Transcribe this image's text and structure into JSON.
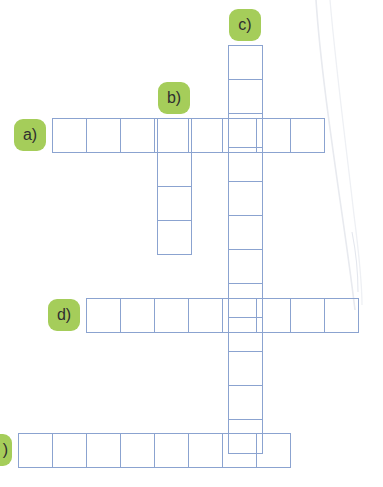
{
  "puzzle": {
    "type": "crossword",
    "title": "Crossword grid",
    "cell_size_px": 35,
    "grid_line_color": "#8ba3d0",
    "badge_color": "#a5cd5a",
    "badge_text_color": "#2f2f2f",
    "background_color": "#ffffff",
    "entries": [
      {
        "id": "a",
        "label": "a)",
        "orientation": "horizontal",
        "cells": 8,
        "x": 52,
        "y": 118,
        "badge_x": 14,
        "badge_y": 119,
        "badge_clipped": false,
        "letters": [
          "",
          "",
          "",
          "",
          "",
          "",
          "",
          ""
        ]
      },
      {
        "id": "b",
        "label": "b)",
        "orientation": "vertical",
        "cells": 4,
        "x": 157,
        "y": 118,
        "badge_x": 158,
        "badge_y": 82,
        "badge_clipped": false,
        "letters": [
          "",
          "",
          "",
          ""
        ]
      },
      {
        "id": "c",
        "label": "c)",
        "orientation": "vertical",
        "cells": 12,
        "x": 228,
        "y": 45,
        "badge_x": 229,
        "badge_y": 9,
        "badge_clipped": false,
        "letters": [
          "",
          "",
          "",
          "",
          "",
          "",
          "",
          "",
          "",
          "",
          "",
          ""
        ]
      },
      {
        "id": "d",
        "label": "d)",
        "orientation": "horizontal",
        "cells": 8,
        "x": 86,
        "y": 298,
        "badge_x": 48,
        "badge_y": 299,
        "badge_clipped": false,
        "letters": [
          "",
          "",
          "",
          "",
          "",
          "",
          "",
          ""
        ]
      },
      {
        "id": "e",
        "label": ")",
        "orientation": "horizontal",
        "cells": 8,
        "x": 18,
        "y": 433,
        "badge_x": -20,
        "badge_y": 434,
        "badge_clipped": true,
        "letters": [
          "",
          "",
          "",
          "",
          "",
          "",
          "",
          ""
        ]
      }
    ]
  }
}
